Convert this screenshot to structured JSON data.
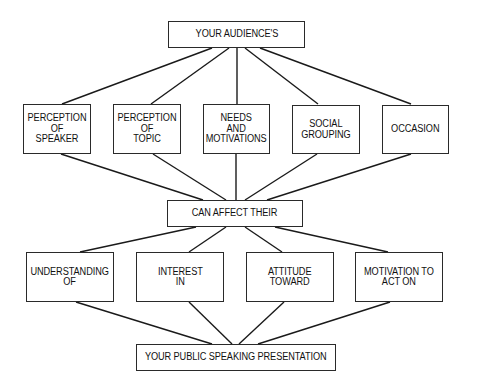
{
  "diagram": {
    "top": {
      "label": "YOUR AUDIENCE'S"
    },
    "factors": [
      {
        "label": "PERCEPTION\nOF\nSPEAKER"
      },
      {
        "label": "PERCEPTION\nOF\nTOPIC"
      },
      {
        "label": "NEEDS\nAND\nMOTIVATIONS"
      },
      {
        "label": "SOCIAL\nGROUPING"
      },
      {
        "label": "OCCASION"
      }
    ],
    "middle": {
      "label": "CAN AFFECT THEIR"
    },
    "effects": [
      {
        "label": "UNDERSTANDING\nOF"
      },
      {
        "label": "INTEREST\nIN"
      },
      {
        "label": "ATTITUDE\nTOWARD"
      },
      {
        "label": "MOTIVATION TO\nACT ON"
      }
    ],
    "bottom": {
      "label": "YOUR PUBLIC SPEAKING PRESENTATION"
    }
  }
}
